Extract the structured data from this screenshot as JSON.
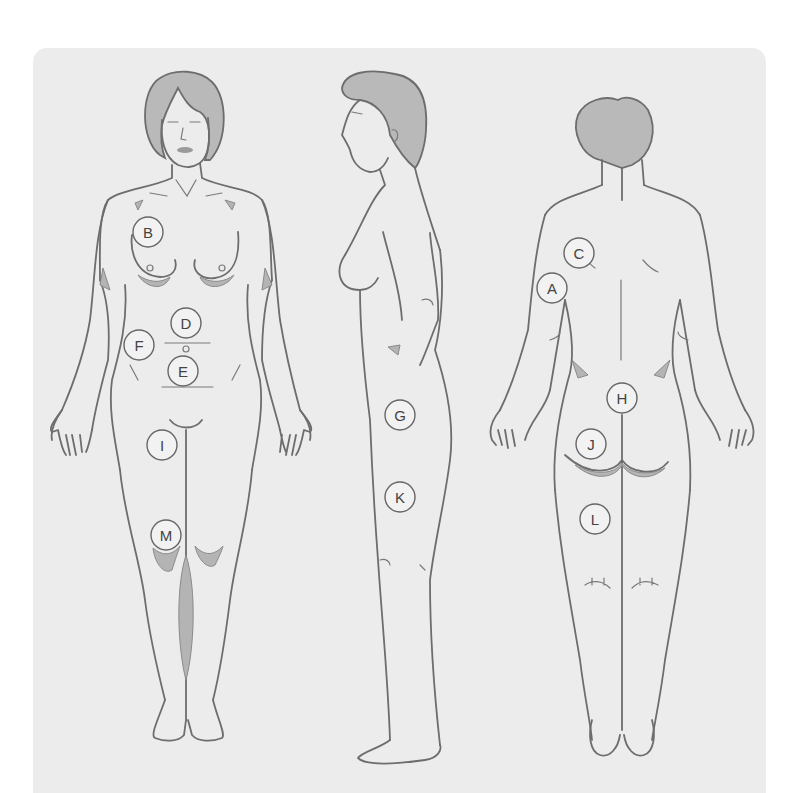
{
  "diagram": {
    "views": [
      {
        "id": "front",
        "label": "front-view"
      },
      {
        "id": "side",
        "label": "side-view"
      },
      {
        "id": "back",
        "label": "back-view"
      }
    ],
    "markers": [
      {
        "letter": "A",
        "view": "back"
      },
      {
        "letter": "B",
        "view": "front"
      },
      {
        "letter": "C",
        "view": "back"
      },
      {
        "letter": "D",
        "view": "front"
      },
      {
        "letter": "E",
        "view": "front"
      },
      {
        "letter": "F",
        "view": "front"
      },
      {
        "letter": "G",
        "view": "side"
      },
      {
        "letter": "H",
        "view": "back"
      },
      {
        "letter": "I",
        "view": "front"
      },
      {
        "letter": "J",
        "view": "back"
      },
      {
        "letter": "K",
        "view": "side"
      },
      {
        "letter": "L",
        "view": "back"
      },
      {
        "letter": "M",
        "view": "front"
      }
    ],
    "colors": {
      "panel_background": "#ececec",
      "line": "#6d6d6d",
      "shading": "#b4b4b4"
    }
  }
}
